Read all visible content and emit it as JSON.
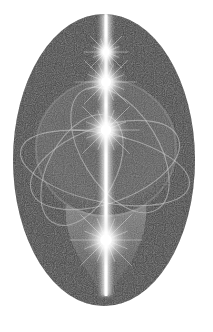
{
  "image": {
    "description": "Grayscale illustration of a dark oval with a vertical beam of light, radiant star bursts, and orbiting elliptical rings around a sphere",
    "background": "#ffffff",
    "oval": {
      "cx": 104,
      "cy": 160,
      "rx": 91,
      "ry": 146,
      "fill": "#3f3f3f"
    },
    "beam": {
      "x": 106,
      "top": 14,
      "bottom": 296,
      "color": "#ffffff"
    },
    "stars": [
      {
        "name": "star-top",
        "cx": 106,
        "cy": 52,
        "r": 16
      },
      {
        "name": "star-upper",
        "cx": 106,
        "cy": 82,
        "r": 22
      },
      {
        "name": "star-center",
        "cx": 106,
        "cy": 130,
        "r": 24
      },
      {
        "name": "star-bottom",
        "cx": 106,
        "cy": 240,
        "r": 26
      }
    ],
    "sphere": {
      "cx": 106,
      "cy": 148,
      "rx": 70,
      "ry": 68
    },
    "orbits": [
      {
        "cx": 105,
        "cy": 168,
        "rx": 86,
        "ry": 34,
        "rotate": 12
      },
      {
        "cx": 105,
        "cy": 165,
        "rx": 78,
        "ry": 38,
        "rotate": -20
      },
      {
        "cx": 120,
        "cy": 150,
        "rx": 38,
        "ry": 70,
        "rotate": -32
      },
      {
        "cx": 82,
        "cy": 170,
        "rx": 34,
        "ry": 60,
        "rotate": 28
      }
    ],
    "flame": {
      "tip_y": 296,
      "top_y": 205,
      "half_width": 40
    }
  }
}
